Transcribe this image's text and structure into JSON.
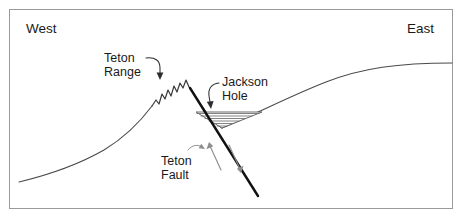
{
  "diagram": {
    "orientation": {
      "west_label": "West",
      "east_label": "East"
    },
    "features": [
      {
        "id": "teton-range",
        "label_line_1": "Teton",
        "label_line_2": "Range",
        "description": "Uplifted footwall block forming jagged mountain peaks",
        "leader": "curved-arrow-down-right"
      },
      {
        "id": "jackson-hole",
        "label_line_1": "Jackson",
        "label_line_2": "Hole",
        "description": "Downdropped hanging wall basin filled with horizontal sediment layers",
        "leader": "curved-arrow-down-left"
      },
      {
        "id": "teton-fault",
        "label_line_1": "Teton",
        "label_line_2": "Fault",
        "description": "Normal fault dipping east, footwall up and hanging wall down",
        "leader": "small-curved-arrow-up-right"
      }
    ],
    "sediment_layer_count": 6,
    "colors": {
      "background": "#ffffff",
      "frame": "#9a9a9a",
      "terrain": "#4a4a4a",
      "fault": "#111111",
      "sediment": "#6d6d6d",
      "label_text": "#1a1a1a",
      "motion_arrow": "#8d8d8d"
    }
  }
}
